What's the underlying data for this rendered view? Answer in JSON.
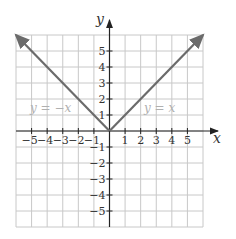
{
  "chart_data": {
    "type": "line",
    "title": "",
    "xlabel": "x",
    "ylabel": "y",
    "xlim": [
      -6,
      6
    ],
    "ylim": [
      -6,
      6
    ],
    "grid": true,
    "x_ticks": [
      -5,
      -4,
      -3,
      -2,
      -1,
      1,
      2,
      3,
      4,
      5
    ],
    "y_ticks": [
      -5,
      -4,
      -3,
      -2,
      -1,
      1,
      2,
      3,
      4,
      5
    ],
    "x_tick_labels": [
      "−5",
      "−4",
      "−3",
      "−2",
      "−1",
      "1",
      "2",
      "3",
      "4",
      "5"
    ],
    "y_tick_labels": [
      "5",
      "4",
      "3",
      "2",
      "1",
      "−1",
      "−2",
      "−3",
      "−4",
      "−5"
    ],
    "series": [
      {
        "name": "y = −x",
        "x": [
          0,
          -6
        ],
        "y": [
          0,
          6
        ],
        "domain": "x ≤ 0",
        "arrow": true
      },
      {
        "name": "y = x",
        "x": [
          0,
          6
        ],
        "y": [
          0,
          6
        ],
        "domain": "x ≥ 0",
        "arrow": true
      }
    ],
    "annotations": [
      {
        "text": "y = −x",
        "x": -4.5,
        "y": 1.5
      },
      {
        "text": "y = x",
        "x": 2.2,
        "y": 1.5
      }
    ],
    "colors": {
      "line": "#6b6b6b",
      "grid": "#c8c8c8",
      "axis": "#222222",
      "annotation": "#b0b0b0"
    }
  },
  "labels": {
    "x_axis": "x",
    "y_axis": "y",
    "eq_left": "y = −x",
    "eq_right": "y = x"
  }
}
